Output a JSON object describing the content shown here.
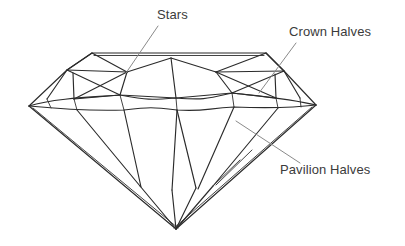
{
  "diagram": {
    "view": "side-profile",
    "line_color": "#2b2b2b",
    "leader_color": "#8a8a8a",
    "label_color": "#3b3b3b",
    "background_color": "#ffffff"
  },
  "labels": [
    {
      "id": "stars",
      "text": "Stars",
      "x": 157,
      "y": 7,
      "leader_from": [
        157,
        25
      ],
      "leader_to": [
        127,
        72
      ]
    },
    {
      "id": "crown_halves",
      "text": "Crown Halves",
      "x": 289,
      "y": 24,
      "leader_from": [
        293,
        42
      ],
      "leader_to": [
        258,
        93
      ]
    },
    {
      "id": "pavilion_halves",
      "text": "Pavilion Halves",
      "x": 280,
      "y": 162,
      "leader_from": [
        297,
        162
      ],
      "leader_to": [
        236,
        121
      ]
    }
  ],
  "geometry": {
    "table_left": [
      92,
      53
    ],
    "table_right": [
      266,
      53
    ],
    "girdle_left_tip": [
      29,
      106
    ],
    "girdle_right_tip": [
      316,
      105
    ],
    "culet": [
      176,
      229
    ],
    "crown_corner_left": [
      67,
      70
    ],
    "crown_corner_right": [
      284,
      71
    ]
  },
  "parts": {
    "table": "table facet",
    "crown": "crown",
    "girdle": "girdle",
    "pavilion": "pavilion",
    "culet": "culet"
  }
}
